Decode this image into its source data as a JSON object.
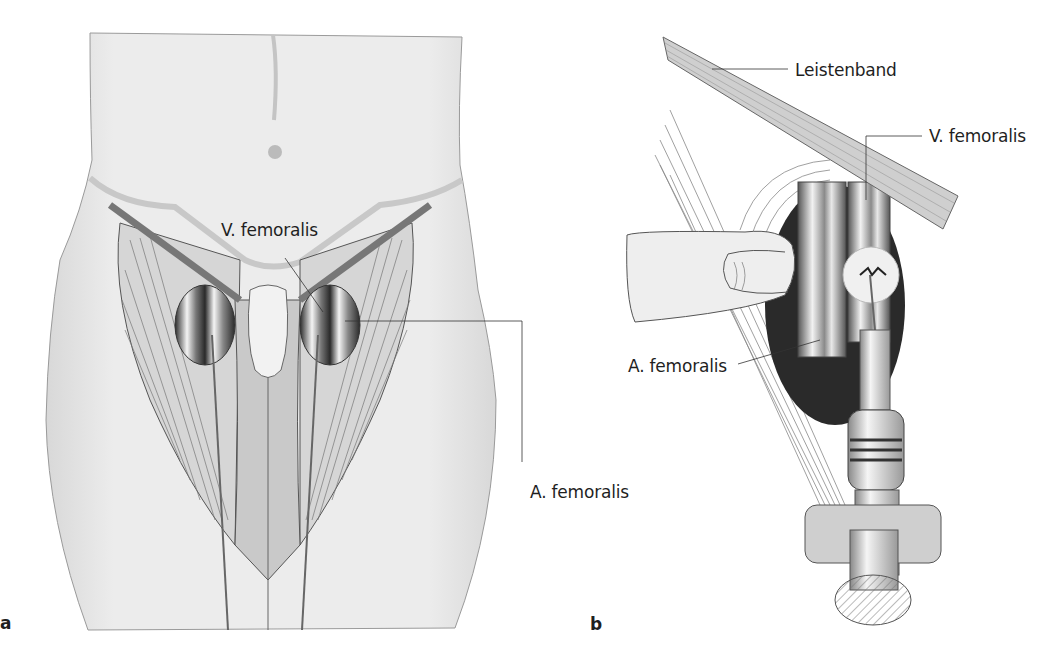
{
  "figure": {
    "panels": [
      {
        "id": "a",
        "letter": "a",
        "description": "Anterior view of lower abdomen and thighs showing femoral vessels below the inguinal ligament",
        "labels": {
          "vein": "V. femoralis",
          "artery": "A. femoralis"
        }
      },
      {
        "id": "b",
        "letter": "b",
        "description": "Close-up of femoral vein puncture with syringe while palpating the femoral artery with a finger",
        "labels": {
          "ligament": "Leistenband",
          "vein": "V. femoralis",
          "artery": "A. femoralis"
        }
      }
    ]
  },
  "colors": {
    "skin": "#e9e9e9",
    "skin_shadow": "#cfcfcf",
    "muscle": "#d4d4d4",
    "outline": "#555555",
    "dark_cavity": "#262626",
    "vessel_light": "#f2f2f2",
    "vessel_dark": "#6a6a6a",
    "label_text": "#1f1f1f"
  }
}
